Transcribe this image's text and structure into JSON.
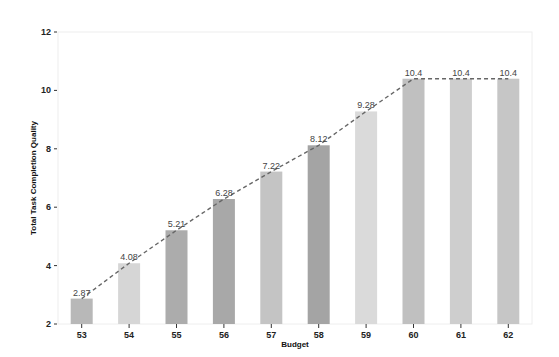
{
  "chart_data": {
    "type": "bar",
    "title": "",
    "xlabel": "Budget",
    "ylabel": "Total Task Completion Quality",
    "categories": [
      "53",
      "54",
      "55",
      "56",
      "57",
      "58",
      "59",
      "60",
      "61",
      "62"
    ],
    "values": [
      2.87,
      4.08,
      5.21,
      6.28,
      7.22,
      8.12,
      9.28,
      10.4,
      10.4,
      10.4
    ],
    "value_labels": [
      "2.87",
      "4.08",
      "5.21",
      "6.28",
      "7.22",
      "8.12",
      "9.28",
      "10.4",
      "10.4",
      "10.4"
    ],
    "overlay_line": {
      "style": "dashed",
      "color": "#666666",
      "values": [
        2.87,
        4.08,
        5.21,
        6.28,
        7.22,
        8.12,
        9.28,
        10.4,
        10.4,
        10.4
      ]
    },
    "ylim": [
      2,
      12
    ],
    "yticks": [
      2,
      4,
      6,
      8,
      10,
      12
    ],
    "grid": false,
    "legend": null,
    "bar_colors": [
      "#b8b8b8",
      "#d6d6d6",
      "#acacac",
      "#a8a8a8",
      "#c4c4c4",
      "#a4a4a4",
      "#dadada",
      "#c0c0c0",
      "#cecece",
      "#c6c6c6"
    ]
  }
}
